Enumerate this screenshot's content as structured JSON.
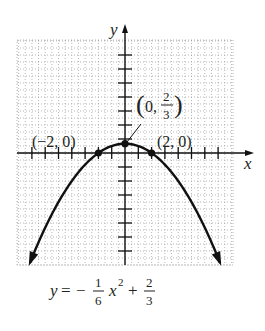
{
  "chart_data": {
    "type": "line",
    "title": "",
    "function": "y = -(1/6)x^2 + 2/3",
    "equation_label": {
      "lhs": "y",
      "eq": "=",
      "minus": "−",
      "frac1_num": "1",
      "frac1_den": "6",
      "var": "x",
      "exp": "2",
      "plus": "+",
      "frac2_num": "2",
      "frac2_den": "3"
    },
    "xlabel": "x",
    "ylabel": "y",
    "xlim": [
      -8,
      8
    ],
    "ylim": [
      -8,
      8
    ],
    "grid": true,
    "tick_step": 1,
    "points": [
      {
        "x": -2,
        "y": 0,
        "label": "(−2, 0)"
      },
      {
        "x": 0,
        "y": 0.6667,
        "label_open": "(0, ",
        "label_num": "2",
        "label_den": "3",
        "label_close": ")"
      },
      {
        "x": 2,
        "y": 0,
        "label": "(2, 0)"
      }
    ],
    "curve_x_range": [
      -7.15,
      7.15
    ],
    "colors": {
      "curve": "#111111",
      "axis": "#111111",
      "grid": "#9a9a9a",
      "text": "#231f20"
    }
  }
}
